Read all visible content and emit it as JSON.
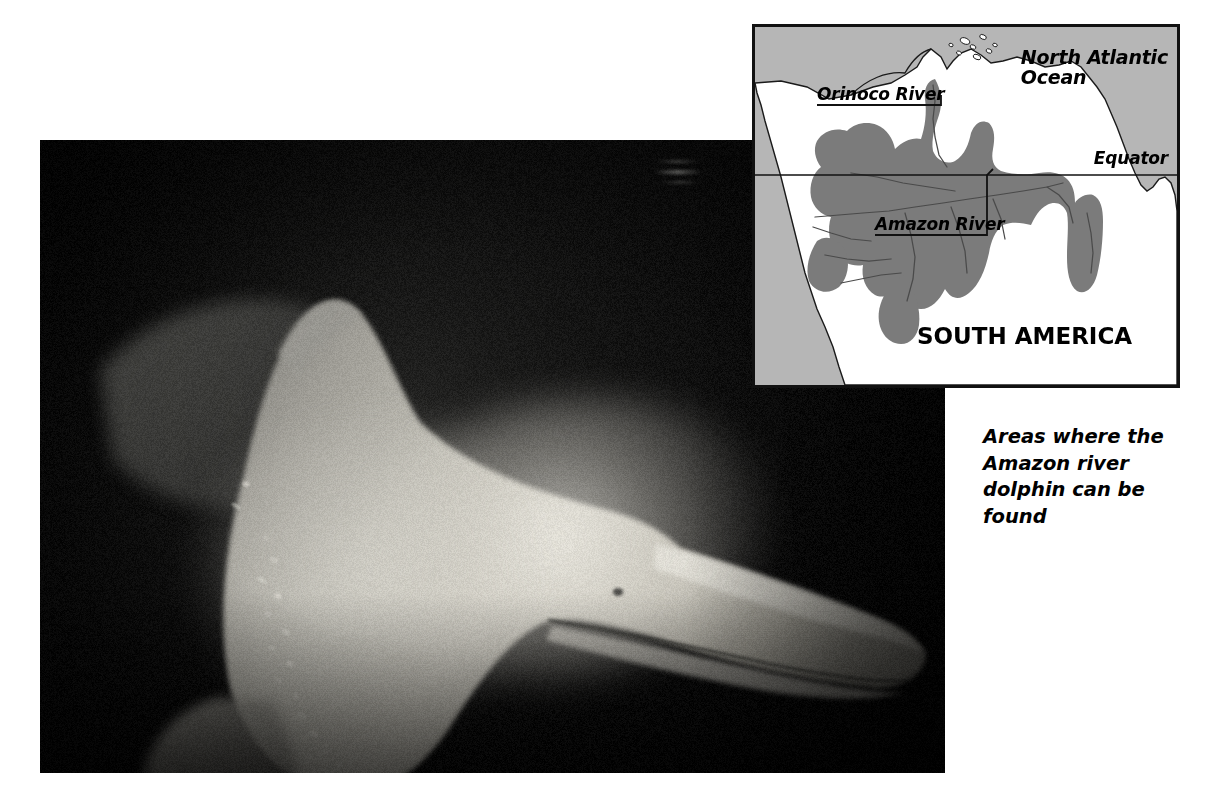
{
  "page": {
    "width": 1214,
    "height": 808,
    "background": "#ffffff"
  },
  "photo": {
    "name": "amazon-river-dolphin-photograph",
    "subject": "Amazon river dolphin (boto) swimming underwater",
    "description": "Pale pink-grey river dolphin photographed underwater against a dark background, showing its long narrow beak, bulbous melon, low dorsal ridge and broad flipper",
    "frame": {
      "x": 40,
      "y": 140,
      "width": 905,
      "height": 633
    },
    "palette": {
      "background_dark": "#070707",
      "water_shadow": "#2b2b2b",
      "body_mid": "#8e8e8a",
      "body_light": "#c9c7bf",
      "body_highlight": "#e8e6de"
    }
  },
  "map": {
    "name": "amazon-river-dolphin-range-map",
    "frame": {
      "x": 752,
      "y": 24,
      "width": 428,
      "height": 364
    },
    "palette": {
      "ocean": "#b6b6b6",
      "land": "#ffffff",
      "range": "#7b7b7b",
      "outline": "#1a1a1a",
      "border": "#111111"
    },
    "labels": {
      "north_atlantic_line1": "North Atlantic",
      "north_atlantic_line2": "Ocean",
      "equator": "Equator",
      "orinoco_river": "Orinoco River",
      "amazon_river": "Amazon River",
      "south_america": "SOUTH AMERICA"
    }
  },
  "caption": {
    "name": "range-map-caption",
    "text": "Areas where the Amazon river dolphin can be found",
    "lines": [
      "Areas where the",
      "Amazon river",
      "dolphin can be",
      "found"
    ]
  }
}
